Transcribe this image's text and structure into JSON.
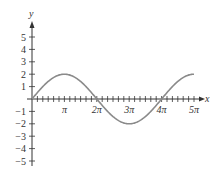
{
  "chart_data": {
    "type": "line",
    "title": "",
    "xlabel": "x",
    "ylabel": "y",
    "function": "y = 2 sin(x/2)",
    "xlim": [
      0,
      15.708
    ],
    "ylim": [
      -5,
      5
    ],
    "grid": false,
    "legend": null,
    "x_tick_labels": [
      "π",
      "2π",
      "3π",
      "4π",
      "5π"
    ],
    "x_tick_values": [
      3.1416,
      6.2832,
      9.4248,
      12.5664,
      15.708
    ],
    "x_minor_tick_step": "π/6",
    "y_tick_labels": [
      "5",
      "4",
      "3",
      "2",
      "1",
      "−1",
      "−2",
      "−3",
      "−4",
      "−5"
    ],
    "y_tick_values": [
      5,
      4,
      3,
      2,
      1,
      -1,
      -2,
      -3,
      -4,
      -5
    ],
    "series": [
      {
        "name": "y = 2 sin(x/2)",
        "color": "#8a8a8a",
        "x": [
          0,
          1.5708,
          3.1416,
          4.7124,
          6.2832,
          7.854,
          9.4248,
          10.9956,
          12.5664,
          14.1372,
          15.708
        ],
        "values": [
          0,
          1.414,
          2,
          1.414,
          0,
          -1.414,
          -2,
          -1.414,
          0,
          1.414,
          2
        ]
      }
    ]
  },
  "colors": {
    "axis": "#333333",
    "curve": "#8a8a8a",
    "background": "#ffffff"
  }
}
